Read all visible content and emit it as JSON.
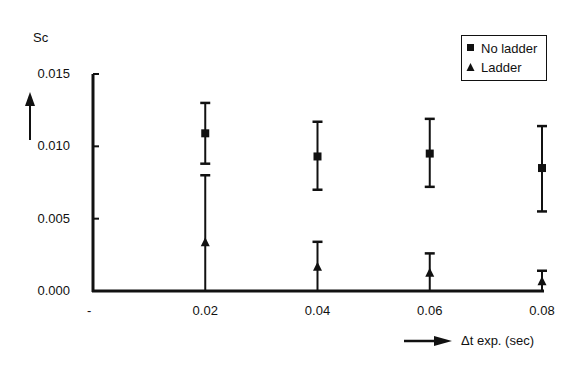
{
  "chart_data": {
    "type": "scatter",
    "title": "",
    "ylabel": "Sc",
    "xlabel": "Δt exp. (sec)",
    "x_origin_label": "-",
    "categories": [
      "0.02",
      "0.04",
      "0.06",
      "0.08"
    ],
    "x": [
      0.02,
      0.04,
      0.06,
      0.08
    ],
    "xlim": [
      0,
      0.08
    ],
    "ylim": [
      0,
      0.015
    ],
    "yticks": [
      "0.015",
      "0.010",
      "0.005",
      "0.000"
    ],
    "ytick_values": [
      0.015,
      0.01,
      0.005,
      0.0
    ],
    "grid": false,
    "legend_position": "top-right",
    "error_bars": true,
    "series": [
      {
        "name": "No ladder",
        "marker": "square",
        "values": [
          0.0109,
          0.0093,
          0.0095,
          0.0085
        ],
        "err_low": [
          0.0088,
          0.007,
          0.0072,
          0.0055
        ],
        "err_high": [
          0.013,
          0.0117,
          0.0119,
          0.0114
        ]
      },
      {
        "name": "Ladder",
        "marker": "triangle",
        "values": [
          0.0033,
          0.0016,
          0.0012,
          0.0006
        ],
        "err_low": [
          0.0,
          0.0,
          0.0,
          0.0
        ],
        "err_high": [
          0.008,
          0.0034,
          0.0026,
          0.0014
        ]
      }
    ]
  },
  "labels": {
    "y_axis_title": "Sc",
    "x_axis_title": "Δt exp. (sec)",
    "x_origin": "-",
    "legend": [
      "No ladder",
      "Ladder"
    ]
  }
}
